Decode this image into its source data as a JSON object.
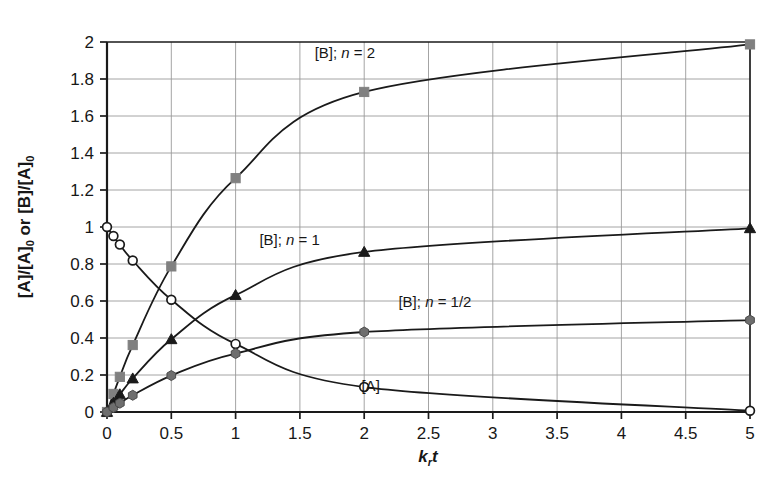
{
  "chart_data": {
    "type": "line",
    "title": "",
    "subtitle": "",
    "xlabel": "k_r t",
    "xlabel_parts": {
      "base": "k",
      "sub": "r",
      "tail": "t"
    },
    "ylabel": "[A]/[A]0 or [B]/[A]0",
    "ylabel_parts": {
      "a1": "[A]/[A]",
      "a1sub": "0",
      "mid": " or [B]/[A]",
      "a2sub": "0"
    },
    "xlim": [
      0,
      5
    ],
    "ylim": [
      0,
      2
    ],
    "xticks": [
      "0",
      "0.5",
      "1",
      "1.5",
      "2",
      "2.5",
      "3",
      "3.5",
      "4",
      "4.5",
      "5"
    ],
    "xtick_values": [
      0,
      0.5,
      1,
      1.5,
      2,
      2.5,
      3,
      3.5,
      4,
      4.5,
      5
    ],
    "yticks": [
      "0",
      "0.2",
      "0.4",
      "0.6",
      "0.8",
      "1",
      "1.2",
      "1.4",
      "1.6",
      "1.8",
      "2"
    ],
    "ytick_values": [
      0,
      0.2,
      0.4,
      0.6,
      0.8,
      1,
      1.2,
      1.4,
      1.6,
      1.8,
      2
    ],
    "grid": true,
    "grid_color": "#9a9a9a",
    "axis_color": "#1a1a1a",
    "legend_position": "inline-annotations",
    "x": [
      0,
      0.05,
      0.1,
      0.2,
      0.5,
      1,
      2,
      5
    ],
    "series": [
      {
        "name": "[A]",
        "label": "[A]",
        "label_x": 2.05,
        "label_y": 0.115,
        "marker": "open-circle",
        "marker_color": "#ffffff",
        "marker_edge": "#1a1a1a",
        "line_color": "#1a1a1a",
        "values": [
          1.0,
          0.951,
          0.905,
          0.819,
          0.607,
          0.368,
          0.135,
          0.0067
        ]
      },
      {
        "name": "[B]; n = 2",
        "label": "[B]; n = 2",
        "label_parts": {
          "pre": "[B]; ",
          "ital": "n",
          "post": " = 2"
        },
        "label_x": 1.85,
        "label_y": 1.915,
        "marker": "square",
        "marker_color": "#808080",
        "marker_edge": "#808080",
        "line_color": "#1a1a1a",
        "values": [
          0.0,
          0.0976,
          0.19,
          0.362,
          0.787,
          1.264,
          1.73,
          1.987
        ]
      },
      {
        "name": "[B]; n = 1",
        "label": "[B]; n = 1",
        "label_parts": {
          "pre": "[B]; ",
          "ital": "n",
          "post": " = 1"
        },
        "label_x": 1.42,
        "label_y": 0.905,
        "marker": "triangle",
        "marker_color": "#1a1a1a",
        "marker_edge": "#1a1a1a",
        "line_color": "#1a1a1a",
        "values": [
          0.0,
          0.0488,
          0.0952,
          0.181,
          0.393,
          0.632,
          0.865,
          0.993
        ]
      },
      {
        "name": "[B]; n = 1/2",
        "label": "[B]; n = 1/2",
        "label_parts": {
          "pre": "[B]; ",
          "ital": "n",
          "post": " = 1/2"
        },
        "label_x": 2.55,
        "label_y": 0.565,
        "marker": "hexagon",
        "marker_color": "#6e6e6e",
        "marker_edge": "#4a4a4a",
        "line_color": "#1a1a1a",
        "values": [
          0.0,
          0.0244,
          0.0476,
          0.0905,
          0.197,
          0.316,
          0.4325,
          0.4967
        ]
      }
    ]
  },
  "figure": {
    "caption": ""
  }
}
